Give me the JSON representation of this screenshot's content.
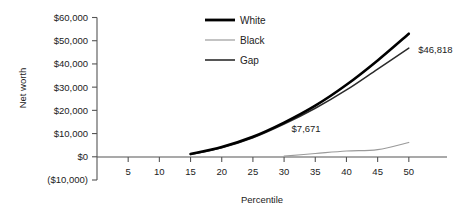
{
  "chart_data": {
    "type": "line",
    "title": "",
    "xlabel": "Percentile",
    "ylabel": "Net worth",
    "xlim": [
      0,
      55
    ],
    "ylim": [
      -10000,
      60000
    ],
    "grid": false,
    "legend_position": "top-center",
    "x_tick_labels": [
      "5",
      "10",
      "15",
      "20",
      "25",
      "30",
      "35",
      "40",
      "45",
      "50"
    ],
    "x_ticks": [
      5,
      10,
      15,
      20,
      25,
      30,
      35,
      40,
      45,
      50
    ],
    "y_tick_labels": [
      "$60,000",
      "$50,000",
      "$40,000",
      "$30,000",
      "$20,000",
      "$10,000",
      "$0",
      "($10,000)"
    ],
    "y_ticks": [
      60000,
      50000,
      40000,
      30000,
      20000,
      10000,
      0,
      -10000
    ],
    "series": [
      {
        "name": "White",
        "color": "#000000",
        "width": 2.6,
        "x": [
          15,
          20,
          25,
          30,
          35,
          40,
          45,
          50
        ],
        "values": [
          1200,
          4200,
          8600,
          14700,
          22000,
          31000,
          41500,
          53000
        ]
      },
      {
        "name": "Black",
        "color": "#9a9a9a",
        "width": 1.1,
        "x": [
          30,
          35,
          40,
          45,
          50
        ],
        "values": [
          300,
          1400,
          2500,
          3100,
          6182
        ]
      },
      {
        "name": "Gap",
        "color": "#2b2b2b",
        "width": 1.5,
        "x": [
          15,
          20,
          25,
          30,
          35,
          40,
          45,
          50
        ],
        "values": [
          1000,
          3900,
          8200,
          14100,
          20900,
          28800,
          37800,
          46818
        ]
      }
    ],
    "annotations": [
      {
        "text": "$7,671",
        "x": 31.2,
        "y": 10600
      },
      {
        "text": "$46,818",
        "x": 51.5,
        "y": 44500
      }
    ],
    "legend": [
      {
        "label": "White",
        "color": "#000000",
        "width": 2.8
      },
      {
        "label": "Black",
        "color": "#9a9a9a",
        "width": 1.2
      },
      {
        "label": "Gap",
        "color": "#2b2b2b",
        "width": 1.6
      }
    ]
  },
  "axes": {
    "y_axis_label": "Net worth",
    "x_axis_label": "Percentile"
  },
  "colors": {
    "background": "#ffffff",
    "axis": "#555555",
    "text": "#222222",
    "white_series": "#000000",
    "black_series": "#9a9a9a",
    "gap_series": "#2b2b2b"
  }
}
